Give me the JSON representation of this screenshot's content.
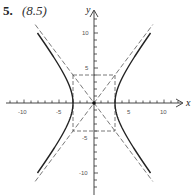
{
  "problem": {
    "number": "5.",
    "reference": "(8.5)"
  },
  "chart_data": {
    "type": "line",
    "title": "",
    "xlabel": "x",
    "ylabel": "y",
    "xlim": [
      -10,
      10
    ],
    "ylim": [
      -10,
      10
    ],
    "x_tick_labels": [
      "-10",
      "-5",
      "5",
      "10"
    ],
    "y_tick_labels": [
      "10",
      "5",
      "-5",
      "-10"
    ],
    "grid": false,
    "series": [
      {
        "name": "hyperbola",
        "equation": "x^2/9 - y^2/16 = 1",
        "style": "solid",
        "vertices": [
          [
            -3,
            0
          ],
          [
            3,
            0
          ]
        ]
      },
      {
        "name": "asymptote_1",
        "equation": "y = 4x/3",
        "style": "dashed"
      },
      {
        "name": "asymptote_2",
        "equation": "y = -4x/3",
        "style": "dashed"
      },
      {
        "name": "fundamental_rectangle",
        "corners": [
          [
            -3,
            4
          ],
          [
            3,
            4
          ],
          [
            3,
            -4
          ],
          [
            -3,
            -4
          ]
        ],
        "style": "dashed"
      }
    ]
  },
  "axes": {
    "x_label": "x",
    "y_label": "y",
    "x_ticks": [
      {
        "value": -10,
        "label": "-10"
      },
      {
        "value": -5,
        "label": "-5"
      },
      {
        "value": 5,
        "label": "5"
      },
      {
        "value": 10,
        "label": "10"
      }
    ],
    "y_ticks": [
      {
        "value": 10,
        "label": "10"
      },
      {
        "value": 5,
        "label": "5"
      },
      {
        "value": -5,
        "label": "-5"
      },
      {
        "value": -10,
        "label": "-10"
      }
    ]
  }
}
